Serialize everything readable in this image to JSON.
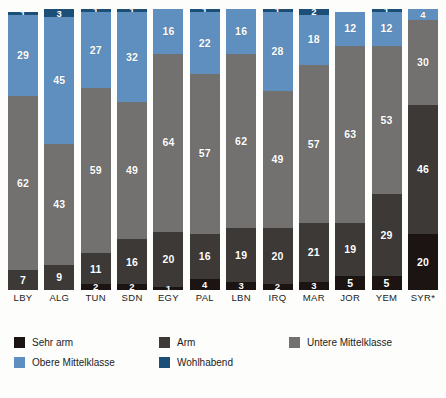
{
  "chart_data": {
    "type": "bar",
    "title": "",
    "subtitle": "",
    "xlabel": "",
    "ylabel": "",
    "ylim": [
      0,
      100
    ],
    "grid": false,
    "stacked": true,
    "stack_order": "bottom-to-top",
    "legend_position": "bottom-left",
    "categories": [
      "LBY",
      "ALG",
      "TUN",
      "SDN",
      "EGY",
      "PAL",
      "LBN",
      "IRQ",
      "MAR",
      "JOR",
      "YEM",
      "SYR*"
    ],
    "series": [
      {
        "name": "Sehr arm",
        "color": "#1c1413",
        "values": [
          0,
          0,
          2,
          2,
          1,
          4,
          3,
          2,
          3,
          5,
          5,
          20
        ]
      },
      {
        "name": "Arm",
        "color": "#3d3937",
        "values": [
          7,
          9,
          11,
          16,
          20,
          16,
          19,
          20,
          21,
          19,
          29,
          46
        ]
      },
      {
        "name": "Untere Mittelklasse",
        "color": "#72716f",
        "values": [
          62,
          43,
          59,
          49,
          64,
          57,
          62,
          49,
          57,
          63,
          53,
          30
        ]
      },
      {
        "name": "Obere Mittelklasse",
        "color": "#5f8fbf",
        "values": [
          29,
          45,
          27,
          32,
          16,
          22,
          16,
          28,
          18,
          12,
          12,
          4
        ]
      },
      {
        "name": "Wohlhabend",
        "color": "#1c4f78",
        "values": [
          1,
          3,
          1,
          1,
          0,
          1,
          0,
          1,
          2,
          0,
          1,
          0
        ]
      }
    ],
    "legend": [
      {
        "label": "Sehr arm",
        "color": "#1c1413"
      },
      {
        "label": "Arm",
        "color": "#3d3937"
      },
      {
        "label": "Untere Mittelklasse",
        "color": "#72716f"
      },
      {
        "label": "Obere Mittelklasse",
        "color": "#5f8fbf"
      },
      {
        "label": "Wohlhabend",
        "color": "#1c4f78"
      }
    ]
  }
}
